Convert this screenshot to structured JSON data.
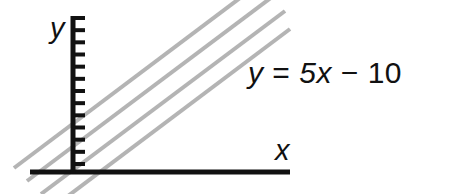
{
  "figure": {
    "type": "line-graph-diagram",
    "background_color": "#ffffff",
    "axis_color": "#111111",
    "line_color": "#b4b4b4"
  },
  "axes": {
    "y_label": "y",
    "x_label": "x",
    "y_axis": {
      "x_px": 73,
      "top_px": 16,
      "bottom_px": 172,
      "tick_count": 14,
      "tick_direction": "right",
      "tick_length_px": 12
    },
    "x_axis": {
      "y_px": 172,
      "left_px": 30,
      "right_px": 290
    }
  },
  "equation": {
    "lhs": "y",
    "equals": "=",
    "slope_term": "5x",
    "operator": "−",
    "intercept": "10",
    "full_text": "y = 5x − 10"
  },
  "chart_data": {
    "type": "line",
    "title": "",
    "xlabel": "x",
    "ylabel": "y",
    "grid": false,
    "legend": "none",
    "annotations": [
      "y = 5x − 10"
    ],
    "series": [
      {
        "name": "line-1",
        "slope_px": 0.75,
        "x1_px": 14,
        "y1_px": 168,
        "x2_px": 256,
        "y2_px": -14
      },
      {
        "name": "line-2",
        "slope_px": 0.75,
        "x1_px": 27,
        "y1_px": 181,
        "x2_px": 272,
        "y2_px": -3
      },
      {
        "name": "line-3",
        "slope_px": 0.75,
        "x1_px": 41,
        "y1_px": 194,
        "x2_px": 285,
        "y2_px": 11
      },
      {
        "name": "line-4",
        "slope_px": 0.75,
        "x1_px": 60,
        "y1_px": 202,
        "x2_px": 290,
        "y2_px": 29
      }
    ]
  }
}
